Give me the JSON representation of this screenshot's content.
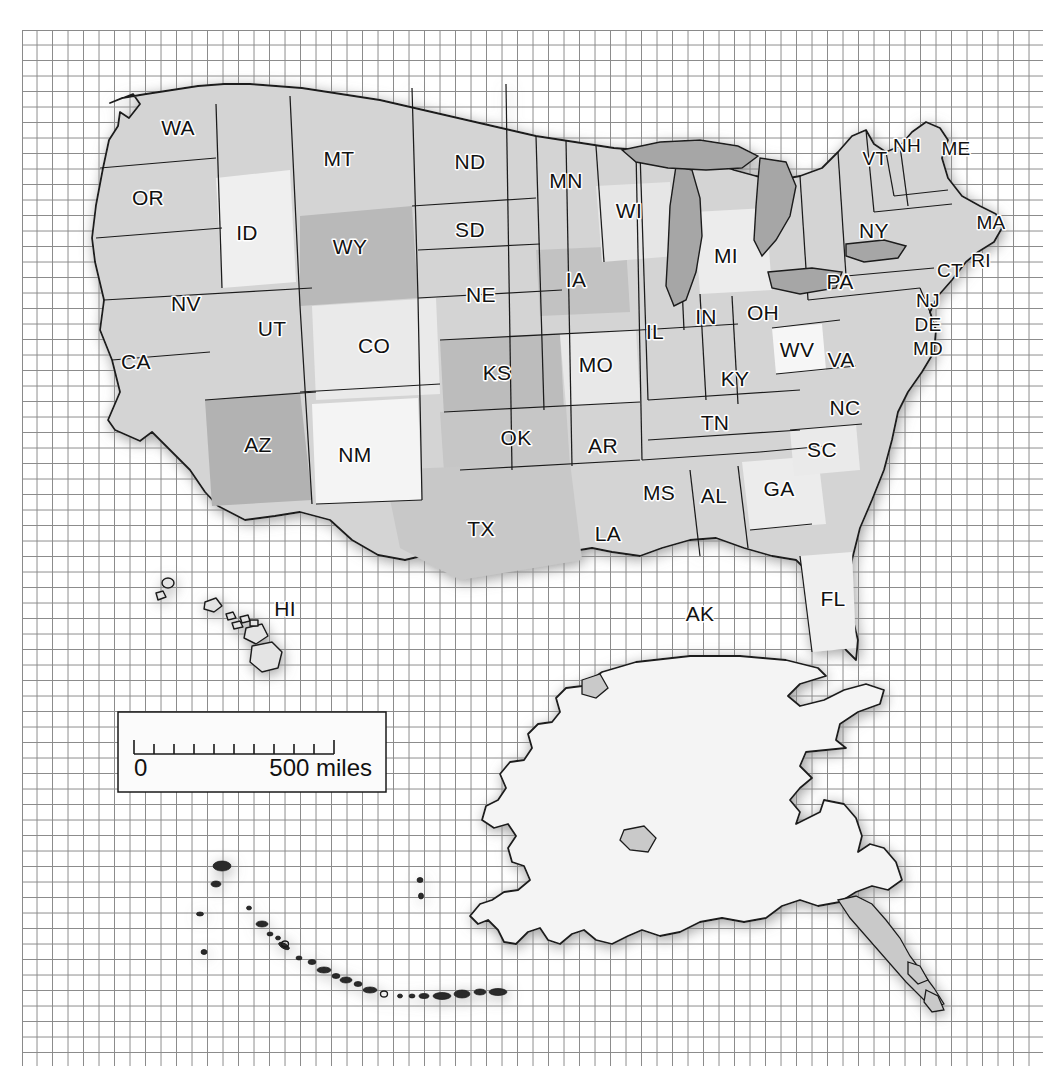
{
  "map": {
    "title": "United States of America — state reference map",
    "projection_note": "Albers-style tilted graticule",
    "background_color": "#ffffff",
    "grid": {
      "visible": true,
      "line_color": "#8a8a8a",
      "cell_size_px": 15.5,
      "origin_x": 22,
      "origin_y": 30,
      "extent_x": 1043,
      "extent_y": 1066
    },
    "land_fill_light": "#f2f2f2",
    "land_fill_mid": "#d8d8d8",
    "land_fill_dark": "#b4b4b4",
    "water_fill": "#a9a9a9",
    "border_color": "#1a1a1a",
    "shadow_color": "#9a9a9a"
  },
  "scale_bar": {
    "name": "scale-bar",
    "min_label": "0",
    "max_label": "500 miles",
    "tick_count": 11,
    "box_x": 118,
    "box_y": 712,
    "box_width": 268,
    "box_height": 80,
    "box_fill": "#fbfbfb",
    "box_stroke": "#1a1a1a"
  },
  "states": [
    {
      "code": "WA",
      "name": "Washington",
      "label_x": 178,
      "label_y": 129,
      "tone": "mid"
    },
    {
      "code": "OR",
      "name": "Oregon",
      "label_x": 148,
      "label_y": 199,
      "tone": "mid"
    },
    {
      "code": "ID",
      "name": "Idaho",
      "label_x": 247,
      "label_y": 234,
      "tone": "light"
    },
    {
      "code": "MT",
      "name": "Montana",
      "label_x": 339,
      "label_y": 160,
      "tone": "mid"
    },
    {
      "code": "WY",
      "name": "Wyoming",
      "label_x": 350,
      "label_y": 248,
      "tone": "dark"
    },
    {
      "code": "NV",
      "name": "Nevada",
      "label_x": 186,
      "label_y": 305,
      "tone": "mid"
    },
    {
      "code": "UT",
      "name": "Utah",
      "label_x": 272,
      "label_y": 330,
      "tone": "mid"
    },
    {
      "code": "CO",
      "name": "Colorado",
      "label_x": 374,
      "label_y": 347,
      "tone": "light"
    },
    {
      "code": "CA",
      "name": "California",
      "label_x": 136,
      "label_y": 363,
      "tone": "mid"
    },
    {
      "code": "AZ",
      "name": "Arizona",
      "label_x": 258,
      "label_y": 446,
      "tone": "dark"
    },
    {
      "code": "NM",
      "name": "New Mexico",
      "label_x": 355,
      "label_y": 456,
      "tone": "light"
    },
    {
      "code": "ND",
      "name": "North Dakota",
      "label_x": 470,
      "label_y": 163,
      "tone": "mid"
    },
    {
      "code": "SD",
      "name": "South Dakota",
      "label_x": 470,
      "label_y": 231,
      "tone": "mid"
    },
    {
      "code": "NE",
      "name": "Nebraska",
      "label_x": 481,
      "label_y": 296,
      "tone": "mid"
    },
    {
      "code": "KS",
      "name": "Kansas",
      "label_x": 497,
      "label_y": 374,
      "tone": "dark"
    },
    {
      "code": "OK",
      "name": "Oklahoma",
      "label_x": 516,
      "label_y": 439,
      "tone": "mid"
    },
    {
      "code": "TX",
      "name": "Texas",
      "label_x": 481,
      "label_y": 530,
      "tone": "mid"
    },
    {
      "code": "MN",
      "name": "Minnesota",
      "label_x": 566,
      "label_y": 182,
      "tone": "mid"
    },
    {
      "code": "IA",
      "name": "Iowa",
      "label_x": 576,
      "label_y": 281,
      "tone": "dark"
    },
    {
      "code": "MO",
      "name": "Missouri",
      "label_x": 596,
      "label_y": 366,
      "tone": "light"
    },
    {
      "code": "AR",
      "name": "Arkansas",
      "label_x": 603,
      "label_y": 447,
      "tone": "mid"
    },
    {
      "code": "LA",
      "name": "Louisiana",
      "label_x": 608,
      "label_y": 535,
      "tone": "mid"
    },
    {
      "code": "WI",
      "name": "Wisconsin",
      "label_x": 629,
      "label_y": 212,
      "tone": "light"
    },
    {
      "code": "IL",
      "name": "Illinois",
      "label_x": 655,
      "label_y": 333,
      "tone": "mid"
    },
    {
      "code": "MS",
      "name": "Mississippi",
      "label_x": 659,
      "label_y": 494,
      "tone": "mid"
    },
    {
      "code": "MI",
      "name": "Michigan",
      "label_x": 726,
      "label_y": 257,
      "tone": "light"
    },
    {
      "code": "IN",
      "name": "Indiana",
      "label_x": 706,
      "label_y": 318,
      "tone": "mid"
    },
    {
      "code": "KY",
      "name": "Kentucky",
      "label_x": 735,
      "label_y": 380,
      "tone": "mid"
    },
    {
      "code": "TN",
      "name": "Tennessee",
      "label_x": 715,
      "label_y": 424,
      "tone": "mid"
    },
    {
      "code": "AL",
      "name": "Alabama",
      "label_x": 714,
      "label_y": 497,
      "tone": "mid"
    },
    {
      "code": "OH",
      "name": "Ohio",
      "label_x": 763,
      "label_y": 314,
      "tone": "mid"
    },
    {
      "code": "WV",
      "name": "West Virginia",
      "label_x": 797,
      "label_y": 351,
      "tone": "light"
    },
    {
      "code": "GA",
      "name": "Georgia",
      "label_x": 779,
      "label_y": 490,
      "tone": "light"
    },
    {
      "code": "SC",
      "name": "South Carolina",
      "label_x": 822,
      "label_y": 451,
      "tone": "light"
    },
    {
      "code": "NC",
      "name": "North Carolina",
      "label_x": 845,
      "label_y": 409,
      "tone": "mid"
    },
    {
      "code": "VA",
      "name": "Virginia",
      "label_x": 841,
      "label_y": 361,
      "tone": "mid"
    },
    {
      "code": "FL",
      "name": "Florida",
      "label_x": 833,
      "label_y": 600,
      "tone": "light"
    },
    {
      "code": "PA",
      "name": "Pennsylvania",
      "label_x": 840,
      "label_y": 283,
      "tone": "mid"
    },
    {
      "code": "NY",
      "name": "New York",
      "label_x": 874,
      "label_y": 232,
      "tone": "mid"
    },
    {
      "code": "VT",
      "name": "Vermont",
      "label_x": 875,
      "label_y": 160,
      "tone": "mid"
    },
    {
      "code": "NH",
      "name": "New Hampshire",
      "label_x": 907,
      "label_y": 147,
      "tone": "light"
    },
    {
      "code": "ME",
      "name": "Maine",
      "label_x": 956,
      "label_y": 150,
      "tone": "light"
    },
    {
      "code": "MA",
      "name": "Massachusetts",
      "label_x": 991,
      "label_y": 224,
      "tone": "mid"
    },
    {
      "code": "RI",
      "name": "Rhode Island",
      "label_x": 981,
      "label_y": 262,
      "tone": "mid"
    },
    {
      "code": "CT",
      "name": "Connecticut",
      "label_x": 950,
      "label_y": 272,
      "tone": "mid"
    },
    {
      "code": "NJ",
      "name": "New Jersey",
      "label_x": 928,
      "label_y": 302,
      "tone": "mid"
    },
    {
      "code": "DE",
      "name": "Delaware",
      "label_x": 928,
      "label_y": 326,
      "tone": "mid"
    },
    {
      "code": "MD",
      "name": "Maryland",
      "label_x": 928,
      "label_y": 350,
      "tone": "mid"
    },
    {
      "code": "HI",
      "name": "Hawaii",
      "label_x": 285,
      "label_y": 610,
      "tone": "light"
    },
    {
      "code": "AK",
      "name": "Alaska",
      "label_x": 700,
      "label_y": 615,
      "tone": "light"
    }
  ]
}
